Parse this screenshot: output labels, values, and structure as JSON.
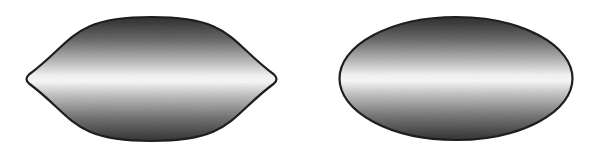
{
  "figure": {
    "background": "#ffffff",
    "shapes": [
      {
        "id": "lens",
        "type": "lens",
        "label": "",
        "bounds": {
          "x1": 24,
          "y1": 17,
          "x2": 279,
          "y2": 141
        },
        "stroke": "#1e1e1e",
        "stroke_width": 2.2
      },
      {
        "id": "ellipse",
        "type": "ellipse",
        "label": "",
        "center": {
          "cx": 456,
          "cy": 78.5
        },
        "radii": {
          "rx": 116.5,
          "ry": 61.5
        },
        "stroke": "#1e1e1e",
        "stroke_width": 2.2
      }
    ],
    "gradient": {
      "direction": "vertical",
      "stops": [
        {
          "offset": 0.0,
          "color": "#2f2f2f"
        },
        {
          "offset": 0.18,
          "color": "#6a6a6a"
        },
        {
          "offset": 0.36,
          "color": "#bdbdbd"
        },
        {
          "offset": 0.47,
          "color": "#f4f4f4"
        },
        {
          "offset": 0.52,
          "color": "#fbfbfb"
        },
        {
          "offset": 0.62,
          "color": "#c8c8c8"
        },
        {
          "offset": 0.8,
          "color": "#7a7a7a"
        },
        {
          "offset": 1.0,
          "color": "#353535"
        }
      ]
    }
  }
}
